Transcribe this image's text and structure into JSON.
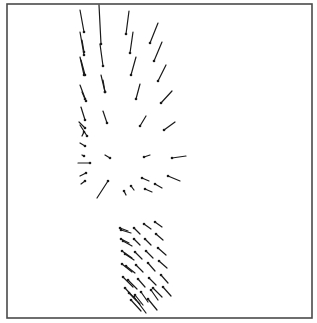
{
  "chart_data": {
    "type": "quiver",
    "title": "",
    "xlabel": "",
    "ylabel": "",
    "grid": false,
    "legend": null,
    "frame": {
      "x": 7,
      "y": 4,
      "width": 305,
      "height": 314
    },
    "style": {
      "line_color": "#1a1a1a",
      "frame_color": "#4a4a4a",
      "background": "#ffffff"
    },
    "note": "Vector field plot; each vector given as tail (x1,y1) and head (x2,y2) in pixel coords; head marked by dot.",
    "groups": [
      {
        "name": "upper-converging-field",
        "vectors": [
          {
            "x1": 80,
            "y1": 10,
            "x2": 84,
            "y2": 32
          },
          {
            "x1": 99,
            "y1": 5,
            "x2": 101,
            "y2": 44
          },
          {
            "x1": 129,
            "y1": 11,
            "x2": 126,
            "y2": 34
          },
          {
            "x1": 158,
            "y1": 23,
            "x2": 150,
            "y2": 43
          },
          {
            "x1": 80,
            "y1": 32,
            "x2": 84,
            "y2": 55
          },
          {
            "x1": 82,
            "y1": 40,
            "x2": 84,
            "y2": 52
          },
          {
            "x1": 100,
            "y1": 44,
            "x2": 103,
            "y2": 66
          },
          {
            "x1": 133,
            "y1": 32,
            "x2": 130,
            "y2": 53
          },
          {
            "x1": 162,
            "y1": 42,
            "x2": 154,
            "y2": 61
          },
          {
            "x1": 80,
            "y1": 57,
            "x2": 84,
            "y2": 75
          },
          {
            "x1": 81,
            "y1": 60,
            "x2": 85,
            "y2": 75
          },
          {
            "x1": 101,
            "y1": 75,
            "x2": 105,
            "y2": 92
          },
          {
            "x1": 136,
            "y1": 57,
            "x2": 131,
            "y2": 75
          },
          {
            "x1": 166,
            "y1": 65,
            "x2": 158,
            "y2": 81
          },
          {
            "x1": 80,
            "y1": 85,
            "x2": 86,
            "y2": 101
          },
          {
            "x1": 82,
            "y1": 92,
            "x2": 85,
            "y2": 99
          },
          {
            "x1": 103,
            "y1": 80,
            "x2": 105,
            "y2": 92
          },
          {
            "x1": 140,
            "y1": 84,
            "x2": 136,
            "y2": 99
          },
          {
            "x1": 172,
            "y1": 91,
            "x2": 161,
            "y2": 103
          },
          {
            "x1": 81,
            "y1": 107,
            "x2": 85,
            "y2": 120
          },
          {
            "x1": 103,
            "y1": 111,
            "x2": 107,
            "y2": 123
          },
          {
            "x1": 146,
            "y1": 116,
            "x2": 140,
            "y2": 126
          },
          {
            "x1": 175,
            "y1": 122,
            "x2": 164,
            "y2": 130
          },
          {
            "x1": 79,
            "y1": 122,
            "x2": 85,
            "y2": 128
          },
          {
            "x1": 80,
            "y1": 125,
            "x2": 87,
            "y2": 136
          },
          {
            "x1": 82,
            "y1": 136,
            "x2": 84,
            "y2": 132
          },
          {
            "x1": 80,
            "y1": 143,
            "x2": 85,
            "y2": 146
          },
          {
            "x1": 82,
            "y1": 155,
            "x2": 84,
            "y2": 156
          },
          {
            "x1": 105,
            "y1": 155,
            "x2": 110,
            "y2": 158
          },
          {
            "x1": 150,
            "y1": 155,
            "x2": 144,
            "y2": 157
          },
          {
            "x1": 186,
            "y1": 156,
            "x2": 172,
            "y2": 158
          },
          {
            "x1": 78,
            "y1": 163,
            "x2": 90,
            "y2": 163
          },
          {
            "x1": 80,
            "y1": 176,
            "x2": 86,
            "y2": 173
          },
          {
            "x1": 81,
            "y1": 184,
            "x2": 85,
            "y2": 181
          },
          {
            "x1": 97,
            "y1": 198,
            "x2": 108,
            "y2": 181
          },
          {
            "x1": 126,
            "y1": 195,
            "x2": 124,
            "y2": 191
          },
          {
            "x1": 134,
            "y1": 190,
            "x2": 131,
            "y2": 186
          },
          {
            "x1": 152,
            "y1": 192,
            "x2": 145,
            "y2": 189
          },
          {
            "x1": 149,
            "y1": 181,
            "x2": 142,
            "y2": 178
          },
          {
            "x1": 162,
            "y1": 188,
            "x2": 155,
            "y2": 184
          },
          {
            "x1": 180,
            "y1": 181,
            "x2": 168,
            "y2": 176
          }
        ]
      },
      {
        "name": "lower-uniform-block",
        "vectors": [
          {
            "x1": 128,
            "y1": 231,
            "x2": 120,
            "y2": 228
          },
          {
            "x1": 131,
            "y1": 233,
            "x2": 121,
            "y2": 230
          },
          {
            "x1": 140,
            "y1": 234,
            "x2": 134,
            "y2": 228
          },
          {
            "x1": 151,
            "y1": 229,
            "x2": 144,
            "y2": 224
          },
          {
            "x1": 162,
            "y1": 227,
            "x2": 155,
            "y2": 222
          },
          {
            "x1": 129,
            "y1": 243,
            "x2": 121,
            "y2": 239
          },
          {
            "x1": 132,
            "y1": 246,
            "x2": 123,
            "y2": 241
          },
          {
            "x1": 140,
            "y1": 245,
            "x2": 134,
            "y2": 239
          },
          {
            "x1": 151,
            "y1": 245,
            "x2": 145,
            "y2": 239
          },
          {
            "x1": 163,
            "y1": 240,
            "x2": 156,
            "y2": 234
          },
          {
            "x1": 132,
            "y1": 258,
            "x2": 122,
            "y2": 251
          },
          {
            "x1": 134,
            "y1": 260,
            "x2": 125,
            "y2": 254
          },
          {
            "x1": 142,
            "y1": 259,
            "x2": 135,
            "y2": 252
          },
          {
            "x1": 153,
            "y1": 258,
            "x2": 146,
            "y2": 251
          },
          {
            "x1": 166,
            "y1": 255,
            "x2": 158,
            "y2": 248
          },
          {
            "x1": 132,
            "y1": 272,
            "x2": 122,
            "y2": 264
          },
          {
            "x1": 135,
            "y1": 273,
            "x2": 126,
            "y2": 266
          },
          {
            "x1": 143,
            "y1": 272,
            "x2": 136,
            "y2": 265
          },
          {
            "x1": 155,
            "y1": 271,
            "x2": 148,
            "y2": 263
          },
          {
            "x1": 167,
            "y1": 268,
            "x2": 159,
            "y2": 261
          },
          {
            "x1": 133,
            "y1": 287,
            "x2": 123,
            "y2": 277
          },
          {
            "x1": 137,
            "y1": 289,
            "x2": 128,
            "y2": 280
          },
          {
            "x1": 145,
            "y1": 287,
            "x2": 138,
            "y2": 279
          },
          {
            "x1": 156,
            "y1": 285,
            "x2": 149,
            "y2": 278
          },
          {
            "x1": 168,
            "y1": 283,
            "x2": 161,
            "y2": 275
          },
          {
            "x1": 136,
            "y1": 300,
            "x2": 125,
            "y2": 288
          },
          {
            "x1": 140,
            "y1": 304,
            "x2": 129,
            "y2": 293
          },
          {
            "x1": 143,
            "y1": 305,
            "x2": 135,
            "y2": 295
          },
          {
            "x1": 148,
            "y1": 302,
            "x2": 141,
            "y2": 292
          },
          {
            "x1": 158,
            "y1": 300,
            "x2": 151,
            "y2": 290
          },
          {
            "x1": 162,
            "y1": 297,
            "x2": 153,
            "y2": 288
          },
          {
            "x1": 171,
            "y1": 296,
            "x2": 163,
            "y2": 287
          },
          {
            "x1": 146,
            "y1": 313,
            "x2": 134,
            "y2": 297
          },
          {
            "x1": 141,
            "y1": 311,
            "x2": 131,
            "y2": 300
          },
          {
            "x1": 157,
            "y1": 310,
            "x2": 148,
            "y2": 299
          }
        ]
      }
    ]
  }
}
